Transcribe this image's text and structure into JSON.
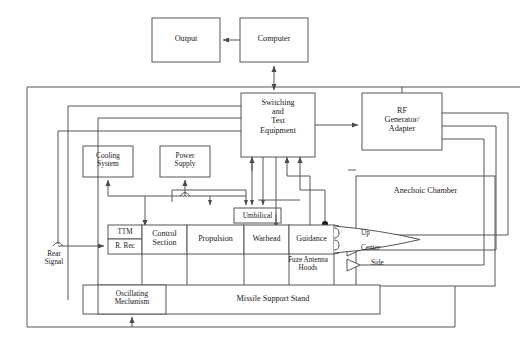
{
  "diagram": {
    "type": "block-diagram",
    "line_color": "#555555",
    "text_color": "#1a1a1a",
    "background": "#ffffff"
  },
  "blocks": {
    "output": "Output",
    "computer": "Computer",
    "switching": "Switching\nand\nTest\nEquipment",
    "rf_generator": "RF\nGenerator/\nAdapter",
    "cooling": "Cooling\nSystem",
    "power_supply": "Power\nSupply",
    "umbilical": "Umbilical",
    "anechoic_chamber": "Anechoic Chamber",
    "oscillating": "Oscillating\nMechanism",
    "support_stand": "Missile Support Stand"
  },
  "missile": {
    "ttm": "TTM",
    "r_rec": "R. Rec",
    "segments": [
      "Control\nSection",
      "Propulsion",
      "Warhead",
      "Guidance"
    ],
    "fuze_hoods": "Fuze Antenna\nHoods"
  },
  "antennas": [
    {
      "label": "Up",
      "name": "antenna-up"
    },
    {
      "label": "Center",
      "name": "antenna-center"
    },
    {
      "label": "Side",
      "name": "antenna-side"
    }
  ],
  "signals": {
    "rear_signal": "Rear\nSignal"
  }
}
